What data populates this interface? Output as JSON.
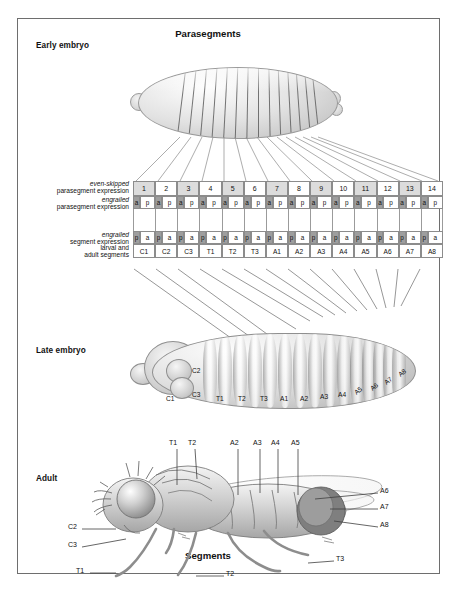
{
  "figure": {
    "top_title": "Parasegments",
    "bottom_title": "Segments"
  },
  "stage_labels": {
    "early": "Early embryo",
    "late": "Late embryo",
    "adult": "Adult"
  },
  "rows": {
    "even_skipped": {
      "gene": "even-skipped",
      "desc": "parasegment expression"
    },
    "engrailed_parasegment": {
      "gene": "engrailed",
      "desc": "parasegment expression"
    },
    "engrailed_segment": {
      "gene": "engrailed",
      "desc": "segment expression"
    },
    "larval_adult": {
      "line1": "larval and",
      "line2": "adult segments"
    }
  },
  "parasegments": {
    "numbers": [
      "1",
      "2",
      "3",
      "4",
      "5",
      "6",
      "7",
      "8",
      "9",
      "10",
      "11",
      "12",
      "13",
      "14"
    ],
    "shade_pattern": [
      "dark",
      "light",
      "dark",
      "light",
      "dark",
      "light",
      "dark",
      "light",
      "dark",
      "light",
      "dark",
      "light",
      "dark",
      "light"
    ],
    "engrailed_cells": [
      "a",
      "p",
      "a",
      "p",
      "a",
      "p",
      "a",
      "p",
      "a",
      "p",
      "a",
      "p",
      "a",
      "p",
      "a",
      "p",
      "a",
      "p",
      "a",
      "p",
      "a",
      "p",
      "a",
      "p",
      "a",
      "p",
      "a",
      "p"
    ]
  },
  "segments": {
    "names": [
      "C1",
      "C2",
      "C3",
      "T1",
      "T2",
      "T3",
      "A1",
      "A2",
      "A3",
      "A4",
      "A5",
      "A6",
      "A7",
      "A8"
    ],
    "engrailed_cells": [
      "p",
      "a",
      "p",
      "a",
      "p",
      "a",
      "p",
      "a",
      "p",
      "a",
      "p",
      "a",
      "p",
      "a",
      "p",
      "a",
      "p",
      "a",
      "p",
      "a",
      "p",
      "a",
      "p",
      "a",
      "p",
      "a",
      "p",
      "a"
    ]
  },
  "late_embryo": {
    "labels": [
      "C1",
      "C2",
      "C3",
      "T1",
      "T2",
      "T3",
      "A1",
      "A2",
      "A3",
      "A4",
      "A5",
      "A6",
      "A7",
      "A8"
    ]
  },
  "adult": {
    "top_labels": [
      "T1",
      "T2",
      "A2",
      "A3",
      "A4",
      "A5"
    ],
    "right_labels": [
      "A6",
      "A7",
      "A8"
    ],
    "left_labels": [
      "C2",
      "C3"
    ],
    "leg_labels": [
      "T1",
      "T2",
      "T3"
    ]
  },
  "colors": {
    "expressing": "#9e9e9e",
    "non_expressing": "#ffffff",
    "parasegment_shade": "#dcdcdc",
    "border": "#8c8c8c",
    "frame": "#6e6e6e"
  }
}
